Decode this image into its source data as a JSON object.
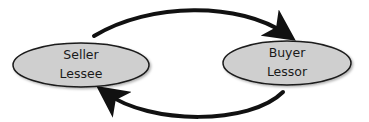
{
  "diagram": {
    "type": "sale-leaseback flow",
    "nodes": [
      {
        "id": "left",
        "line1": "Seller",
        "line2": "Lessee"
      },
      {
        "id": "right",
        "line1": "Buyer",
        "line2": "Lessor"
      }
    ],
    "edges": [
      {
        "from": "left",
        "to": "right",
        "position": "top"
      },
      {
        "from": "right",
        "to": "left",
        "position": "bottom"
      }
    ],
    "colors": {
      "node_fill": "#cfcfcf",
      "node_stroke": "#1a1a1a",
      "arrow": "#111111",
      "background": "#ffffff"
    }
  }
}
